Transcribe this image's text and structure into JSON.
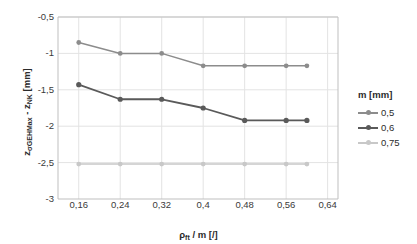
{
  "chart_data": {
    "type": "line",
    "title": "",
    "xlabel": "ρ_ft / m [/]",
    "ylabel": "z_σGEHMax - z_NK [mm]",
    "x": [
      0.16,
      0.24,
      0.32,
      0.4,
      0.48,
      0.56,
      0.6
    ],
    "xlim": [
      0.12,
      0.66
    ],
    "ylim": [
      -3,
      -0.5
    ],
    "xticks": [
      0.16,
      0.24,
      0.32,
      0.4,
      0.48,
      0.56,
      0.64
    ],
    "xtick_labels": [
      "0,16",
      "0,24",
      "0,32",
      "0,4",
      "0,48",
      "0,56",
      "0,64"
    ],
    "yticks": [
      -0.5,
      -1,
      -1.5,
      -2,
      -2.5,
      -3
    ],
    "ytick_labels": [
      "-0,5",
      "-1",
      "-1,5",
      "-2",
      "-2,5",
      "-3"
    ],
    "grid": true,
    "legend_position": "right",
    "legend_title": "m [mm]",
    "series": [
      {
        "name": "0,5",
        "color": "#8c8c8c",
        "values": [
          -0.85,
          -1.0,
          -1.0,
          -1.17,
          -1.17,
          -1.17,
          -1.17
        ]
      },
      {
        "name": "0,6",
        "color": "#5a5a5a",
        "values": [
          -1.43,
          -1.63,
          -1.63,
          -1.75,
          -1.92,
          -1.92,
          -1.92
        ]
      },
      {
        "name": "0,75",
        "color": "#c8c8c8",
        "values": [
          -2.52,
          -2.52,
          -2.52,
          -2.52,
          -2.52,
          -2.52,
          -2.52
        ]
      }
    ]
  },
  "axes": {
    "ylabel_html": "z<sub>σGEHMax</sub> - z<sub>NK</sub> [mm]",
    "xlabel_html": "ρ<sub>ft</sub> / m [/]"
  },
  "colors": {
    "grid": "#e3e3e3",
    "axis": "#bfbfbf",
    "text": "#2b2b2b",
    "background": "#ffffff"
  }
}
